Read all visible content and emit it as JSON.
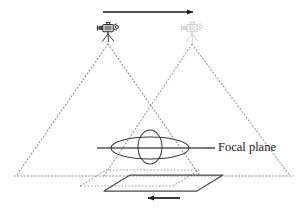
{
  "diagram": {
    "canvas": {
      "width": 307,
      "height": 210,
      "background": "#ffffff"
    },
    "colors": {
      "stroke_dark": "#1a1a1a",
      "stroke_medium": "#5a5a5a",
      "stroke_dotted": "#8a8a8a",
      "stroke_light": "#a8a8a8",
      "camera_solid": "#2b2b2b",
      "camera_faded": "#b5b5b5",
      "label_text": "#1a1a1a"
    },
    "labels": [
      {
        "name": "focal-plane-label",
        "text": "Focal plane",
        "x": 218,
        "y": 148
      }
    ],
    "leader": {
      "name": "focal-plane-leader",
      "text": "—",
      "x1": 204,
      "x2": 216,
      "y": 148
    },
    "cameras": [
      {
        "name": "camera-position-1",
        "state": "solid",
        "apex_x": 108,
        "apex_y": 40,
        "icon": "camera-tripod-icon",
        "opacity": 1.0
      },
      {
        "name": "camera-position-2",
        "state": "faded",
        "apex_x": 192,
        "apex_y": 40,
        "icon": "camera-tripod-icon",
        "opacity": 0.38
      }
    ],
    "cones": [
      {
        "name": "view-cone-left",
        "apex_x": 108,
        "apex_y": 44,
        "base_left_x": 16,
        "base_right_x": 200,
        "base_y": 176,
        "style": "dotted"
      },
      {
        "name": "view-cone-right",
        "apex_x": 192,
        "apex_y": 44,
        "base_left_x": 104,
        "base_right_x": 290,
        "base_y": 176,
        "style": "dotted"
      }
    ],
    "baseline": {
      "name": "ground-baseline",
      "x1": 14,
      "x2": 293,
      "y": 176,
      "style": "dotted"
    },
    "focal_plane": {
      "name": "focal-plane-line",
      "x1": 97,
      "x2": 204,
      "y": 148,
      "style": "solid"
    },
    "ellipses": [
      {
        "name": "footprint-ellipse-wide",
        "cx": 150,
        "cy": 148,
        "rx": 39,
        "ry": 11,
        "style": "solid"
      },
      {
        "name": "footprint-ellipse-tall",
        "cx": 150,
        "cy": 147,
        "rx": 12,
        "ry": 17,
        "style": "solid"
      }
    ],
    "planes": [
      {
        "name": "target-plane-solid",
        "style": "solid",
        "points": "104,191 130,175 223,175 197,191"
      },
      {
        "name": "target-plane-dotted",
        "style": "dotted",
        "points": "80,186 106,170 199,170 173,186"
      }
    ],
    "arrows": [
      {
        "name": "motion-arrow-top",
        "direction": "right",
        "x1": 103,
        "x2": 198,
        "y": 12,
        "label": ""
      },
      {
        "name": "motion-arrow-bottom",
        "direction": "left",
        "x1": 180,
        "x2": 143,
        "y": 198,
        "label": ""
      }
    ]
  }
}
